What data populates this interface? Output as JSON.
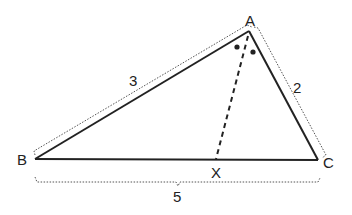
{
  "diagram": {
    "type": "triangle-angle-bisector",
    "vertices": {
      "A": {
        "label": "A",
        "x": 249,
        "y": 31
      },
      "B": {
        "label": "B",
        "x": 35,
        "y": 159
      },
      "C": {
        "label": "C",
        "x": 318,
        "y": 160
      },
      "X": {
        "label": "X",
        "x": 216,
        "y": 160
      }
    },
    "sides": {
      "AB": {
        "label": "3"
      },
      "AC": {
        "label": "2"
      },
      "BC": {
        "label": "5"
      }
    },
    "bisector": {
      "from": "A",
      "to": "X",
      "style": "dashed"
    },
    "angle_marks": {
      "count": 2,
      "style": "dots"
    },
    "colors": {
      "stroke": "#222222",
      "dotted": "#555555",
      "background": "#ffffff"
    }
  }
}
